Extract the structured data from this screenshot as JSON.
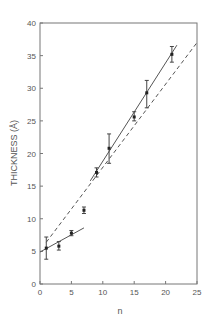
{
  "chart_data": {
    "type": "scatter",
    "title": "",
    "xlabel": "n",
    "ylabel": "THICKNESS (Å)",
    "xlim": [
      0,
      25
    ],
    "ylim": [
      0,
      40
    ],
    "xticks": [
      "0",
      "5",
      "10",
      "15",
      "20",
      "25"
    ],
    "yticks": [
      "0",
      "5",
      "10",
      "15",
      "20",
      "25",
      "30",
      "35",
      "40"
    ],
    "grid": false,
    "legend": null,
    "series": [
      {
        "name": "measured thickness",
        "style": "points with error bars",
        "points": [
          {
            "x": 1,
            "y": 5.5,
            "err_low": 3.8,
            "err_high": 7.2
          },
          {
            "x": 3,
            "y": 5.8,
            "err_low": 5.2,
            "err_high": 6.5
          },
          {
            "x": 5,
            "y": 7.8,
            "err_low": 7.4,
            "err_high": 8.2
          },
          {
            "x": 7,
            "y": 11.3,
            "err_low": 10.8,
            "err_high": 11.8
          },
          {
            "x": 9,
            "y": 17.1,
            "err_low": 16.4,
            "err_high": 17.8
          },
          {
            "x": 11,
            "y": 20.8,
            "err_low": 18.5,
            "err_high": 23.0
          },
          {
            "x": 15,
            "y": 25.6,
            "err_low": 25.0,
            "err_high": 26.4
          },
          {
            "x": 17,
            "y": 29.3,
            "err_low": 27.0,
            "err_high": 31.2
          },
          {
            "x": 21,
            "y": 35.2,
            "err_low": 34.0,
            "err_high": 36.4
          }
        ]
      },
      {
        "name": "fit (short n)",
        "style": "solid",
        "line": [
          [
            0,
            4.9
          ],
          [
            7,
            8.6
          ]
        ]
      },
      {
        "name": "fit (long n)",
        "style": "solid",
        "line": [
          [
            8,
            15.8
          ],
          [
            21.8,
            36.6
          ]
        ]
      },
      {
        "name": "model",
        "style": "dashed",
        "line": [
          [
            1,
            6.4
          ],
          [
            25,
            37.0
          ]
        ]
      }
    ]
  }
}
